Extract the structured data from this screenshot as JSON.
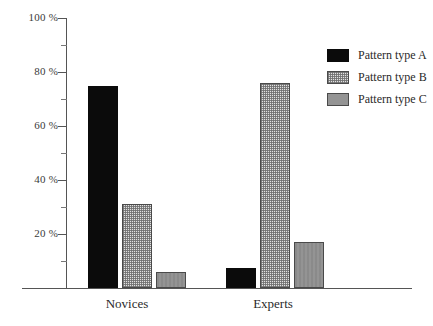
{
  "chart_data": {
    "type": "bar",
    "title": "",
    "subtitle": "",
    "xlabel": "",
    "ylabel": "",
    "categories": [
      "Novices",
      "Experts"
    ],
    "series": [
      {
        "name": "Pattern type A",
        "values": [
          75,
          7.5
        ],
        "color": "#0b0b0b",
        "fill": "solid-black"
      },
      {
        "name": "Pattern type B",
        "values": [
          31,
          76
        ],
        "color": "#e2e2e2",
        "fill": "fine-dotted"
      },
      {
        "name": "Pattern type C",
        "values": [
          6,
          17
        ],
        "color": "#949494",
        "fill": "solid-gray"
      }
    ],
    "ylim": [
      0,
      100
    ],
    "y_unit": "%",
    "y_major_ticks": [
      20,
      40,
      60,
      80,
      100
    ],
    "y_minor_ticks": [
      10,
      30,
      50,
      70,
      90
    ],
    "y_tick_labels": [
      "20 %",
      "40 %",
      "60 %",
      "80 %",
      "100 %"
    ],
    "grid": false,
    "legend_position": "top-right",
    "legend_entries": [
      "Pattern type A",
      "Pattern type B",
      "Pattern type C"
    ]
  },
  "axis": {
    "y_labels": [
      {
        "value": 100,
        "text": "100 %"
      },
      {
        "value": 80,
        "text": "80 %"
      },
      {
        "value": 60,
        "text": "60 %"
      },
      {
        "value": 40,
        "text": "40 %"
      },
      {
        "value": 20,
        "text": "20 %"
      }
    ],
    "x_labels": [
      {
        "text": "Novices"
      },
      {
        "text": "Experts"
      }
    ]
  },
  "legend": {
    "items": [
      {
        "label": "Pattern type A",
        "swatch": "solid-black-swatch"
      },
      {
        "label": "Pattern type B",
        "swatch": "dotted-light-swatch"
      },
      {
        "label": "Pattern type C",
        "swatch": "solid-gray-swatch"
      }
    ]
  }
}
